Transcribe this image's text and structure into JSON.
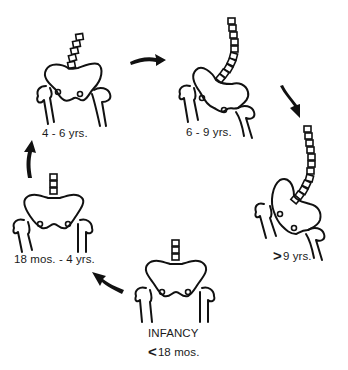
{
  "diagram": {
    "type": "cyclical-stage-diagram",
    "stages": [
      {
        "id": "infancy",
        "label_line1": "INFANCY",
        "label_symbol": "<",
        "label_line2": "18 mos.",
        "position": "bottom-center",
        "vertebrae_visible": 3,
        "spine_curve": "straight"
      },
      {
        "id": "18mos-4yrs",
        "label": "18 mos. - 4 yrs.",
        "position": "left",
        "vertebrae_visible": 2,
        "spine_curve": "straight"
      },
      {
        "id": "4-6yrs",
        "label": "4 - 6 yrs.",
        "position": "top-left",
        "vertebrae_visible": 5,
        "spine_curve": "slight tilt right"
      },
      {
        "id": "6-9yrs",
        "label": "6 - 9 yrs.",
        "position": "top-right",
        "vertebrae_visible": 10,
        "spine_curve": "curved"
      },
      {
        "id": "over9yrs",
        "label_symbol": ">",
        "label": "9 yrs.",
        "position": "right",
        "vertebrae_visible": 12,
        "spine_curve": "long curve"
      }
    ],
    "arrows": [
      {
        "from": "infancy",
        "to": "18mos-4yrs",
        "direction": "up-left"
      },
      {
        "from": "18mos-4yrs",
        "to": "4-6yrs",
        "direction": "up"
      },
      {
        "from": "4-6yrs",
        "to": "6-9yrs",
        "direction": "right"
      },
      {
        "from": "6-9yrs",
        "to": "over9yrs",
        "direction": "down-right"
      }
    ],
    "colors": {
      "ink": "#111111",
      "background": "#ffffff"
    }
  }
}
